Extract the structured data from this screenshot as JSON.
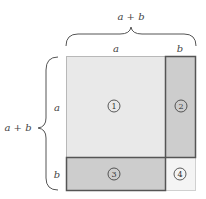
{
  "diagram": {
    "top_brace_label": "a + b",
    "left_brace_label": "a + b",
    "top_labels": {
      "a": "a",
      "b": "b"
    },
    "side_labels": {
      "a": "a",
      "b": "b"
    },
    "regions": [
      {
        "id": "1",
        "label": "1",
        "fill": "#e9e9e9",
        "stroke": "#b8b8b8"
      },
      {
        "id": "2",
        "label": "2",
        "fill": "#cdcdcd",
        "stroke": "#555555"
      },
      {
        "id": "3",
        "label": "3",
        "fill": "#cdcdcd",
        "stroke": "#555555"
      },
      {
        "id": "4",
        "label": "4",
        "fill": "#f4f4f4",
        "stroke": "#d0d0d0"
      }
    ]
  }
}
